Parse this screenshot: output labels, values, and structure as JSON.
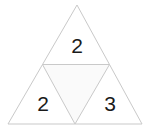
{
  "figure": {
    "name": "subdivided-triangle",
    "background_color": "#ffffff",
    "stroke_color": "#c9c9c9",
    "inner_triangle_fill": "#fafafa",
    "label_color": "#1a1a1a",
    "outer_triangle": {
      "apex": [
        77,
        5
      ],
      "bottom_left": [
        8,
        124
      ],
      "bottom_right": [
        142,
        124
      ]
    },
    "midpoints": {
      "left": [
        42.5,
        64.5
      ],
      "right": [
        109.5,
        64.5
      ],
      "bottom": [
        75,
        124
      ]
    },
    "cells": [
      {
        "id": "top-cell",
        "label": "2",
        "label_x": 77,
        "label_y": 45,
        "shaded": false
      },
      {
        "id": "middle-inverted-cell",
        "label": "",
        "label_x": 76,
        "label_y": 85,
        "shaded": true
      },
      {
        "id": "bottom-left-cell",
        "label": "2",
        "label_x": 43,
        "label_y": 103,
        "shaded": false
      },
      {
        "id": "bottom-right-cell",
        "label": "3",
        "label_x": 110,
        "label_y": 103,
        "shaded": false
      }
    ]
  }
}
